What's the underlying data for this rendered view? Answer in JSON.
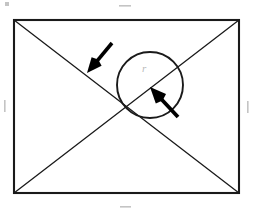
{
  "figure": {
    "background_color": "#ffffff",
    "stroke_color": "#1a1a1a",
    "arrow_color": "#000000",
    "faint_mark_color": "#c4c4c4",
    "labels": {
      "radius": "r"
    },
    "rectangle": {
      "name": "outer-rectangle",
      "x": 14,
      "y": 20,
      "width": 225,
      "height": 173,
      "stroke_width": 2.1
    },
    "diagonals": [
      {
        "name": "diagonal-top-left-to-bottom-right",
        "x1": 14,
        "y1": 20,
        "x2": 239,
        "y2": 193,
        "stroke_width": 1.3
      },
      {
        "name": "diagonal-bottom-left-to-top-right",
        "x1": 14,
        "y1": 193,
        "x2": 239,
        "y2": 20,
        "stroke_width": 1.3
      }
    ],
    "circle": {
      "name": "inscribed-circle",
      "cx": 150,
      "cy": 85,
      "r": 33,
      "stroke_width": 1.9
    },
    "radius_label_position": {
      "x": 142,
      "y": 72
    },
    "arrows": [
      {
        "name": "arrow-upper-left",
        "tail_x": 112,
        "tail_y": 43,
        "tip_x": 87,
        "tip_y": 73,
        "shaft_width": 3.6,
        "head_length": 15,
        "head_width": 13
      },
      {
        "name": "arrow-lower-right",
        "tail_x": 178,
        "tail_y": 117,
        "tip_x": 150,
        "tip_y": 87,
        "shaft_width": 3.8,
        "head_length": 16,
        "head_width": 14
      }
    ],
    "edge_marks": [
      {
        "name": "edge-mark-top",
        "x": 119,
        "y": 5,
        "width": 12,
        "height": 1.6,
        "orientation": "horizontal"
      },
      {
        "name": "edge-mark-bottom",
        "x": 120,
        "y": 206,
        "width": 11,
        "height": 1.6,
        "orientation": "horizontal"
      },
      {
        "name": "edge-mark-left",
        "x": 4,
        "y": 100,
        "width": 1.6,
        "height": 12,
        "orientation": "vertical"
      },
      {
        "name": "edge-mark-right",
        "x": 247,
        "y": 101,
        "width": 1.6,
        "height": 12,
        "orientation": "vertical"
      },
      {
        "name": "edge-mark-corner-top-left",
        "x": 5,
        "y": 2,
        "width": 4,
        "height": 4,
        "orientation": "speck"
      }
    ]
  }
}
